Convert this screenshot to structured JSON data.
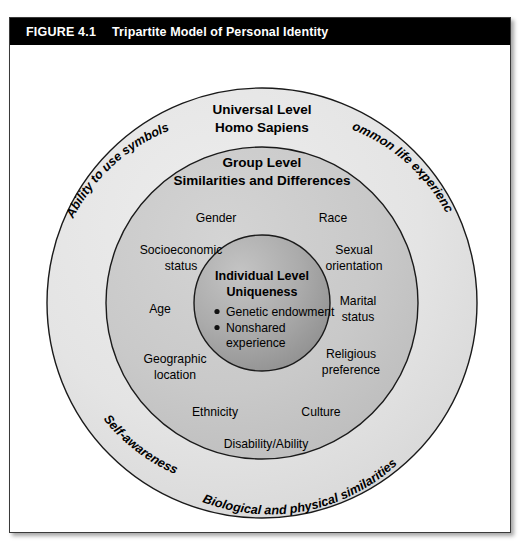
{
  "header": {
    "figure_number": "FIGURE 4.1",
    "figure_title": "Tripartite Model of Personal Identity"
  },
  "colors": {
    "title_bar_bg": "#000000",
    "title_bar_text": "#ffffff",
    "outer_ring_fill": "#e3e3e3",
    "middle_ring_fill": "#c9c9c9",
    "inner_circle_fill": "#a8a8a8",
    "stroke": "#1a1a1a",
    "frame_border": "#3a3a3a"
  },
  "rings": {
    "outer": {
      "title_line1": "Universal Level",
      "title_line2": "Homo Sapiens"
    },
    "middle": {
      "title_line1": "Group Level",
      "title_line2": "Similarities and Differences"
    },
    "inner": {
      "title_line1": "Individual Level",
      "title_line2": "Uniqueness",
      "bullets": [
        "Genetic endowment",
        "Nonshared",
        "experience"
      ]
    }
  },
  "arc_labels": [
    {
      "name": "ability-to-use-symbols",
      "text": "Ability to use symbols"
    },
    {
      "name": "common-life-experiences",
      "text": "Common life experiences"
    },
    {
      "name": "biological-and-physical-similarities",
      "text": "Biological and physical similarities"
    },
    {
      "name": "self-awareness",
      "text": "Self-awareness"
    }
  ],
  "group_attributes": {
    "left": [
      {
        "name": "gender",
        "lines": [
          "Gender"
        ]
      },
      {
        "name": "socioeconomic-status",
        "lines": [
          "Socioeconomic",
          "status"
        ]
      },
      {
        "name": "age",
        "lines": [
          "Age"
        ]
      },
      {
        "name": "geographic-location",
        "lines": [
          "Geographic",
          "location"
        ]
      },
      {
        "name": "ethnicity",
        "lines": [
          "Ethnicity"
        ]
      }
    ],
    "right": [
      {
        "name": "race",
        "lines": [
          "Race"
        ]
      },
      {
        "name": "sexual-orientation",
        "lines": [
          "Sexual",
          "orientation"
        ]
      },
      {
        "name": "marital-status",
        "lines": [
          "Marital",
          "status"
        ]
      },
      {
        "name": "religious-preference",
        "lines": [
          "Religious",
          "preference"
        ]
      },
      {
        "name": "culture",
        "lines": [
          "Culture"
        ]
      }
    ],
    "bottom": [
      {
        "name": "disability-ability",
        "lines": [
          "Disability/Ability"
        ]
      }
    ]
  },
  "geometry": {
    "center_x": 252,
    "center_y": 258,
    "outer_radius": 215,
    "middle_radius": 156,
    "inner_radius": 68
  }
}
